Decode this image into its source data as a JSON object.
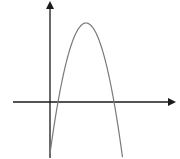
{
  "diagram": {
    "type": "function-graph",
    "colors": {
      "axis": "#1a1a1a",
      "curve": "#7a7a7a",
      "background": "#ffffff"
    },
    "axes": {
      "x_axis": {
        "x1": 13,
        "x2": 175,
        "y": 102,
        "arrow": "right"
      },
      "y_axis": {
        "x": 50,
        "y1": 158,
        "y2": 2,
        "arrow": "up"
      }
    },
    "curve": {
      "kind": "parabola",
      "opens": "down",
      "vertex": {
        "x": 86,
        "y": 23
      },
      "x_intercepts": [
        58,
        114
      ],
      "start": {
        "x": 50,
        "y": 158
      },
      "end": {
        "x": 123,
        "y": 158
      }
    },
    "labels": []
  }
}
